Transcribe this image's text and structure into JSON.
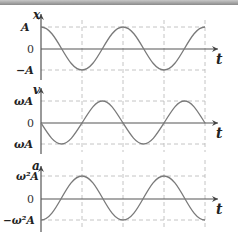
{
  "panels": [
    {
      "id": "displacement",
      "y_label": "x",
      "t_label": "t",
      "tick_top": "A",
      "tick_zero": "0",
      "tick_bottom": "−A",
      "function": "cos"
    },
    {
      "id": "velocity",
      "y_label": "v",
      "t_label": "t",
      "tick_top": "ωA",
      "tick_zero": "0",
      "tick_bottom": "ωA",
      "function": "-sin"
    },
    {
      "id": "acceleration",
      "y_label": "a",
      "t_label": "t",
      "tick_top": "ω²A",
      "tick_zero": "0",
      "tick_bottom": "−ω²A",
      "function": "-cos"
    }
  ],
  "colors": {
    "curve": "#7a7a7a",
    "axis": "#555555",
    "grid": "#b5b5b5",
    "text": "#222222"
  }
}
